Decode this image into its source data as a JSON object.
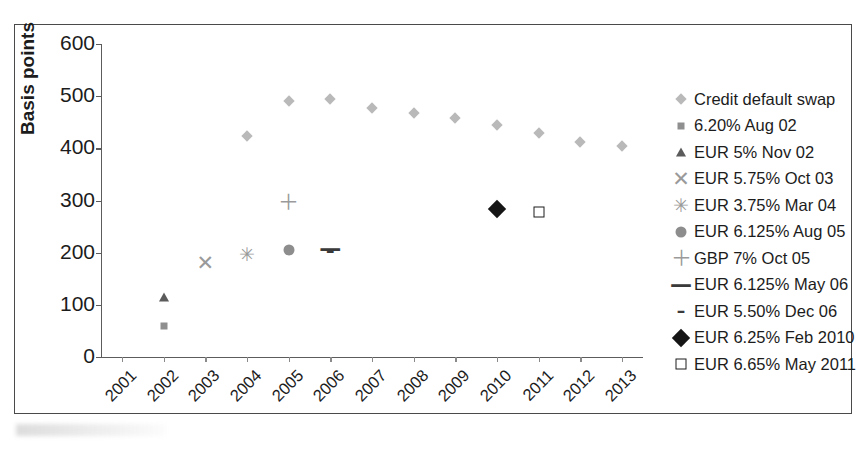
{
  "figure": {
    "frame_border_color": "#4a4a4a",
    "background": "#ffffff"
  },
  "chart_data": {
    "type": "scatter",
    "title": "",
    "xlabel": "",
    "ylabel": "Basis points",
    "grid": false,
    "legend_position": "right",
    "xlim": [
      2000.5,
      2013.5
    ],
    "ylim": [
      0,
      600
    ],
    "yticks": [
      0,
      100,
      200,
      300,
      400,
      500,
      600
    ],
    "categories": [
      "2001",
      "2002",
      "2003",
      "2004",
      "2005",
      "2006",
      "2007",
      "2008",
      "2009",
      "2010",
      "2011",
      "2012",
      "2013"
    ],
    "series": [
      {
        "name": "Credit default swap",
        "marker": "diamond-small",
        "color": "#b9b9b9",
        "points": [
          {
            "x": 2004,
            "y": 424
          },
          {
            "x": 2005,
            "y": 491
          },
          {
            "x": 2006,
            "y": 494
          },
          {
            "x": 2007,
            "y": 477
          },
          {
            "x": 2008,
            "y": 467
          },
          {
            "x": 2009,
            "y": 458
          },
          {
            "x": 2010,
            "y": 445
          },
          {
            "x": 2011,
            "y": 429
          },
          {
            "x": 2012,
            "y": 412
          },
          {
            "x": 2013,
            "y": 405
          }
        ]
      },
      {
        "name": "6.20% Aug 02",
        "marker": "square-small",
        "color": "#8f8f8f",
        "points": [
          {
            "x": 2002,
            "y": 60
          }
        ]
      },
      {
        "name": "EUR 5% Nov 02",
        "marker": "triangle",
        "color": "#5b5b5b",
        "points": [
          {
            "x": 2002,
            "y": 115
          }
        ]
      },
      {
        "name": "EUR 5.75% Oct 03",
        "marker": "x",
        "color": "#9a9a9a",
        "points": [
          {
            "x": 2003,
            "y": 180
          }
        ]
      },
      {
        "name": "EUR 3.75% Mar 04",
        "marker": "star",
        "color": "#9a9a9a",
        "points": [
          {
            "x": 2004,
            "y": 198
          }
        ]
      },
      {
        "name": "EUR 6.125% Aug 05",
        "marker": "circle",
        "color": "#8d8d8d",
        "points": [
          {
            "x": 2005,
            "y": 205
          }
        ]
      },
      {
        "name": "GBP 7% Oct 05",
        "marker": "plus",
        "color": "#9a9a9a",
        "points": [
          {
            "x": 2005,
            "y": 298
          }
        ]
      },
      {
        "name": "EUR 6.125% May 06",
        "marker": "dash-long",
        "color": "#3a3a3a",
        "points": [
          {
            "x": 2006,
            "y": 207
          }
        ]
      },
      {
        "name": "EUR 5.50% Dec 06",
        "marker": "dash-short",
        "color": "#3a3a3a",
        "points": [
          {
            "x": 2006,
            "y": 203
          }
        ]
      },
      {
        "name": "EUR 6.25% Feb 2010",
        "marker": "diamond-black",
        "color": "#151515",
        "points": [
          {
            "x": 2010,
            "y": 283
          }
        ]
      },
      {
        "name": "EUR 6.65% May 2011",
        "marker": "square-open",
        "color": "#1d1d1d",
        "points": [
          {
            "x": 2011,
            "y": 278
          }
        ]
      }
    ]
  },
  "legend": {
    "items": [
      {
        "label": "Credit default swap",
        "marker": "diamond-small"
      },
      {
        "label": "6.20% Aug 02",
        "marker": "square-small"
      },
      {
        "label": "EUR 5% Nov 02",
        "marker": "triangle"
      },
      {
        "label": "EUR 5.75% Oct 03",
        "marker": "x"
      },
      {
        "label": "EUR 3.75% Mar 04",
        "marker": "star"
      },
      {
        "label": "EUR 6.125% Aug 05",
        "marker": "circle"
      },
      {
        "label": "GBP 7% Oct 05",
        "marker": "plus"
      },
      {
        "label": "EUR 6.125% May 06",
        "marker": "dash-long"
      },
      {
        "label": "EUR 5.50% Dec 06",
        "marker": "dash-short"
      },
      {
        "label": "EUR 6.25% Feb 2010",
        "marker": "diamond-black"
      },
      {
        "label": "EUR 6.65% May 2011",
        "marker": "square-open"
      }
    ]
  }
}
